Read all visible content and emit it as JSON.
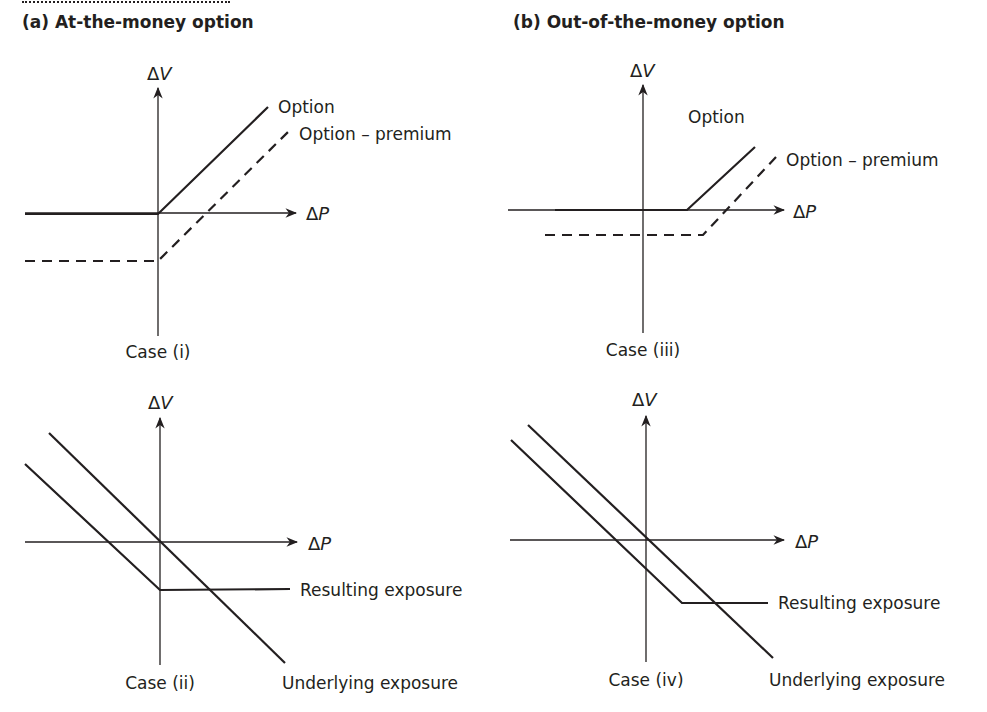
{
  "panels": {
    "a": {
      "title": "(a) At-the-money option"
    },
    "b": {
      "title": "(b) Out-of-the-money option"
    }
  },
  "axes": {
    "x_label_delta": "Δ",
    "x_label_var": "P",
    "y_label_delta": "Δ",
    "y_label_var": "V"
  },
  "cases": {
    "i": {
      "caption": "Case (i)",
      "option_label": "Option",
      "premium_label": "Option – premium"
    },
    "ii": {
      "caption": "Case (ii)",
      "resulting_label": "Resulting exposure",
      "underlying_label": "Underlying exposure"
    },
    "iii": {
      "caption": "Case (iii)",
      "option_label": "Option",
      "premium_label": "Option – premium"
    },
    "iv": {
      "caption": "Case (iv)",
      "resulting_label": "Resulting exposure",
      "underlying_label": "Underlying exposure"
    }
  },
  "colors": {
    "ink": "#231f20",
    "background": "#ffffff"
  }
}
